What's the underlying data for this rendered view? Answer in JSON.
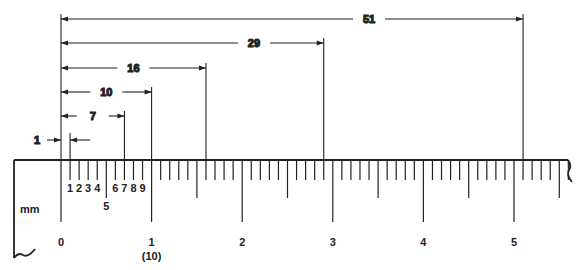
{
  "diagram": {
    "type": "ruler-measurement",
    "unit_label": "mm",
    "ink_color": "#222222",
    "background": "#ffffff",
    "ruler": {
      "origin_x": 61,
      "px_per_mm": 9.06,
      "top_y": 160,
      "total_mm": 56,
      "major_labels": [
        "0",
        "1",
        "2",
        "3",
        "4",
        "5"
      ],
      "sub_label_10": "(10)",
      "minor_labels_first_cm": [
        "1",
        "2",
        "3",
        "4",
        "5",
        "6",
        "7",
        "8",
        "9"
      ]
    },
    "dimensions": [
      {
        "label": "1",
        "mm": 1
      },
      {
        "label": "7",
        "mm": 7
      },
      {
        "label": "10",
        "mm": 10
      },
      {
        "label": "16",
        "mm": 16
      },
      {
        "label": "29",
        "mm": 29
      },
      {
        "label": "51",
        "mm": 51
      }
    ]
  }
}
